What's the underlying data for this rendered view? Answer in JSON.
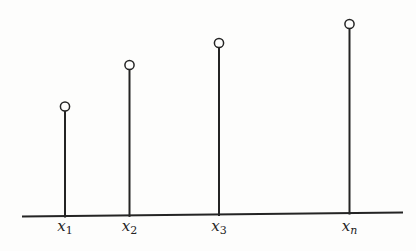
{
  "figure": {
    "background_color": "#fdfdfc",
    "ink_color": "#242424"
  },
  "chart_data": {
    "type": "stem",
    "title": "",
    "xlabel": "",
    "ylabel": "",
    "grid": false,
    "legend": null,
    "axis_ticks_numeric": false,
    "marker": {
      "shape": "open-circle",
      "radius_px": 4.6,
      "stroke_px": 1.5
    },
    "baseline": {
      "x1_px": 22,
      "y1_px": 216.5,
      "x2_px": 403,
      "y2_px": 212.5,
      "stroke_px": 2.2
    },
    "stem_stroke_px": 2,
    "label_baseline_y_px": 230.5,
    "tick_labels": [
      {
        "base": "x",
        "sub": "1"
      },
      {
        "base": "x",
        "sub": "2"
      },
      {
        "base": "x",
        "sub": "3"
      },
      {
        "base": "x",
        "sub": "n"
      }
    ],
    "points": [
      {
        "label_base": "x",
        "label_sub": "1",
        "x_px": 65,
        "top_px": 106.5,
        "height_px": 109,
        "value_rel": 0.52
      },
      {
        "label_base": "x",
        "label_sub": "2",
        "x_px": 129.5,
        "top_px": 65,
        "height_px": 150,
        "value_rel": 0.72
      },
      {
        "label_base": "x",
        "label_sub": "3",
        "x_px": 219,
        "top_px": 43,
        "height_px": 171,
        "value_rel": 0.83
      },
      {
        "label_base": "x",
        "label_sub": "n",
        "x_px": 349.5,
        "top_px": 24,
        "height_px": 189,
        "value_rel": 0.92
      }
    ]
  }
}
